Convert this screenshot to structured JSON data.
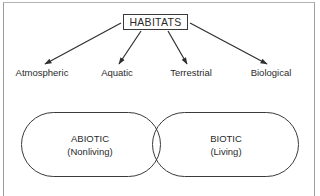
{
  "diagram": {
    "root": {
      "label": "HABITATS"
    },
    "categories": [
      {
        "label": "Atmospheric"
      },
      {
        "label": "Aquatic"
      },
      {
        "label": "Terrestrial"
      },
      {
        "label": "Biological"
      }
    ],
    "ovals": [
      {
        "title": "ABIOTIC",
        "subtitle": "(Nonliving)"
      },
      {
        "title": "BIOTIC",
        "subtitle": "(Living)"
      }
    ],
    "colors": {
      "line": "#2f2f2f",
      "text": "#2a2a2a",
      "frame": "#a0a0a0",
      "background": "#ffffff"
    }
  }
}
